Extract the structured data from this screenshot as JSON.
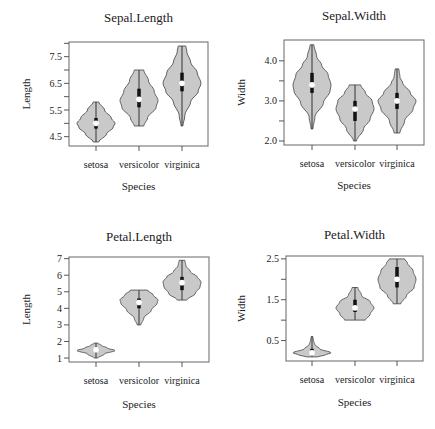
{
  "chart_data": [
    {
      "type": "violin",
      "title": "Sepal.Length",
      "xlabel": "Species",
      "ylabel": "Length",
      "categories": [
        "setosa",
        "versicolor",
        "virginica"
      ],
      "ylim": [
        4.15,
        8.05
      ],
      "yticks": [
        4.5,
        5.0,
        5.5,
        6.0,
        6.5,
        7.0,
        7.5,
        8.0
      ],
      "ytick_labels": [
        "4.5",
        "",
        "5.5",
        "",
        "6.5",
        "",
        "7.5",
        ""
      ],
      "grid": false,
      "series": [
        {
          "name": "setosa",
          "min": 4.3,
          "q1": 4.8,
          "median": 5.0,
          "q3": 5.2,
          "max": 5.8,
          "density": [
            [
              4.3,
              0.15
            ],
            [
              4.6,
              0.55
            ],
            [
              4.85,
              0.9
            ],
            [
              5.0,
              1.0
            ],
            [
              5.2,
              0.8
            ],
            [
              5.5,
              0.45
            ],
            [
              5.8,
              0.15
            ]
          ]
        },
        {
          "name": "versicolor",
          "min": 4.9,
          "q1": 5.6,
          "median": 5.9,
          "q3": 6.3,
          "max": 7.0,
          "density": [
            [
              4.9,
              0.25
            ],
            [
              5.2,
              0.45
            ],
            [
              5.6,
              0.9
            ],
            [
              5.85,
              1.0
            ],
            [
              6.2,
              0.8
            ],
            [
              6.6,
              0.5
            ],
            [
              7.0,
              0.25
            ]
          ]
        },
        {
          "name": "virginica",
          "min": 4.9,
          "q1": 6.2,
          "median": 6.5,
          "q3": 6.9,
          "max": 7.9,
          "density": [
            [
              4.9,
              0.05
            ],
            [
              5.3,
              0.15
            ],
            [
              5.8,
              0.45
            ],
            [
              6.2,
              0.85
            ],
            [
              6.5,
              1.0
            ],
            [
              6.9,
              0.8
            ],
            [
              7.3,
              0.45
            ],
            [
              7.7,
              0.25
            ],
            [
              7.9,
              0.2
            ]
          ]
        }
      ]
    },
    {
      "type": "violin",
      "title": "Sepal.Width",
      "xlabel": "Species",
      "ylabel": "Width",
      "categories": [
        "setosa",
        "versicolor",
        "virginica"
      ],
      "ylim": [
        1.9,
        4.52
      ],
      "yticks": [
        2.0,
        2.5,
        3.0,
        3.5,
        4.0
      ],
      "ytick_labels": [
        "2.0",
        "",
        "3.0",
        "",
        "4.0"
      ],
      "grid": false,
      "series": [
        {
          "name": "setosa",
          "min": 2.3,
          "q1": 3.2,
          "median": 3.4,
          "q3": 3.7,
          "max": 4.4,
          "density": [
            [
              2.3,
              0.05
            ],
            [
              2.6,
              0.15
            ],
            [
              2.95,
              0.6
            ],
            [
              3.25,
              0.95
            ],
            [
              3.4,
              1.0
            ],
            [
              3.65,
              0.85
            ],
            [
              3.9,
              0.5
            ],
            [
              4.1,
              0.25
            ],
            [
              4.4,
              0.1
            ]
          ]
        },
        {
          "name": "versicolor",
          "min": 2.0,
          "q1": 2.5,
          "median": 2.8,
          "q3": 3.0,
          "max": 3.4,
          "density": [
            [
              2.0,
              0.08
            ],
            [
              2.3,
              0.45
            ],
            [
              2.55,
              0.8
            ],
            [
              2.8,
              1.0
            ],
            [
              3.0,
              0.9
            ],
            [
              3.2,
              0.55
            ],
            [
              3.4,
              0.3
            ]
          ]
        },
        {
          "name": "virginica",
          "min": 2.2,
          "q1": 2.8,
          "median": 3.0,
          "q3": 3.2,
          "max": 3.8,
          "density": [
            [
              2.2,
              0.15
            ],
            [
              2.5,
              0.4
            ],
            [
              2.8,
              0.85
            ],
            [
              3.0,
              1.0
            ],
            [
              3.2,
              0.7
            ],
            [
              3.45,
              0.3
            ],
            [
              3.6,
              0.15
            ],
            [
              3.8,
              0.1
            ]
          ]
        }
      ]
    },
    {
      "type": "violin",
      "title": "Petal.Length",
      "xlabel": "Species",
      "ylabel": "Length",
      "categories": [
        "setosa",
        "versicolor",
        "virginica"
      ],
      "ylim": [
        0.76,
        7.1
      ],
      "yticks": [
        1,
        2,
        3,
        4,
        5,
        6,
        7
      ],
      "ytick_labels": [
        "1",
        "2",
        "3",
        "4",
        "5",
        "6",
        "7"
      ],
      "grid": false,
      "series": [
        {
          "name": "setosa",
          "min": 1.0,
          "q1": 1.4,
          "median": 1.5,
          "q3": 1.6,
          "max": 1.9,
          "density": [
            [
              1.0,
              0.1
            ],
            [
              1.25,
              0.45
            ],
            [
              1.45,
              1.0
            ],
            [
              1.6,
              0.6
            ],
            [
              1.75,
              0.3
            ],
            [
              1.9,
              0.1
            ]
          ]
        },
        {
          "name": "versicolor",
          "min": 3.0,
          "q1": 4.0,
          "median": 4.35,
          "q3": 4.6,
          "max": 5.1,
          "density": [
            [
              3.0,
              0.1
            ],
            [
              3.4,
              0.25
            ],
            [
              3.9,
              0.65
            ],
            [
              4.3,
              0.95
            ],
            [
              4.5,
              1.0
            ],
            [
              4.8,
              0.75
            ],
            [
              5.1,
              0.45
            ]
          ]
        },
        {
          "name": "virginica",
          "min": 4.5,
          "q1": 5.1,
          "median": 5.55,
          "q3": 5.9,
          "max": 6.9,
          "density": [
            [
              4.5,
              0.25
            ],
            [
              4.9,
              0.7
            ],
            [
              5.3,
              0.95
            ],
            [
              5.6,
              1.0
            ],
            [
              5.9,
              0.8
            ],
            [
              6.2,
              0.45
            ],
            [
              6.6,
              0.2
            ],
            [
              6.9,
              0.15
            ]
          ]
        }
      ]
    },
    {
      "type": "violin",
      "title": "Petal.Width",
      "xlabel": "Species",
      "ylabel": "Width",
      "categories": [
        "setosa",
        "versicolor",
        "virginica"
      ],
      "ylim": [
        0.0,
        2.57
      ],
      "yticks": [
        0.5,
        1.0,
        1.5,
        2.0,
        2.5
      ],
      "ytick_labels": [
        "0.5",
        "",
        "1.5",
        "",
        "2.5"
      ],
      "grid": false,
      "series": [
        {
          "name": "setosa",
          "min": 0.1,
          "q1": 0.2,
          "median": 0.2,
          "q3": 0.3,
          "max": 0.6,
          "density": [
            [
              0.1,
              0.3
            ],
            [
              0.15,
              0.7
            ],
            [
              0.2,
              1.0
            ],
            [
              0.3,
              0.4
            ],
            [
              0.4,
              0.15
            ],
            [
              0.5,
              0.08
            ],
            [
              0.6,
              0.04
            ]
          ]
        },
        {
          "name": "versicolor",
          "min": 1.0,
          "q1": 1.2,
          "median": 1.3,
          "q3": 1.5,
          "max": 1.8,
          "density": [
            [
              1.0,
              0.55
            ],
            [
              1.15,
              0.8
            ],
            [
              1.3,
              1.0
            ],
            [
              1.45,
              0.8
            ],
            [
              1.6,
              0.35
            ],
            [
              1.8,
              0.15
            ]
          ]
        },
        {
          "name": "virginica",
          "min": 1.4,
          "q1": 1.8,
          "median": 2.0,
          "q3": 2.3,
          "max": 2.5,
          "density": [
            [
              1.4,
              0.2
            ],
            [
              1.6,
              0.5
            ],
            [
              1.8,
              0.9
            ],
            [
              2.0,
              1.0
            ],
            [
              2.2,
              0.85
            ],
            [
              2.4,
              0.55
            ],
            [
              2.5,
              0.4
            ]
          ]
        }
      ]
    }
  ]
}
